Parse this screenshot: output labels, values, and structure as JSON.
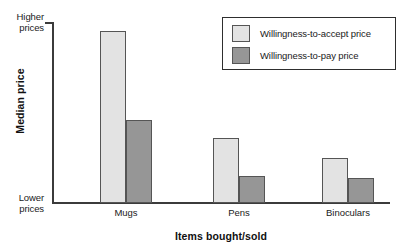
{
  "chart_data": {
    "type": "bar",
    "title": "",
    "subtitle": "",
    "xlabel": "Items bought/sold",
    "ylabel": "Median price",
    "categories": [
      "Mugs",
      "Pens",
      "Binoculars"
    ],
    "series": [
      {
        "name": "Willingness-to-accept price",
        "color": "#e3e3e3",
        "values": [
          95,
          36,
          25
        ]
      },
      {
        "name": "Willingness-to-pay price",
        "color": "#969696",
        "values": [
          46,
          15,
          14
        ]
      }
    ],
    "ylim": [
      0,
      100
    ],
    "y_axis_ticks": [
      {
        "label": "Lower prices",
        "value": 0
      },
      {
        "label": "Higher prices",
        "value": 100
      }
    ],
    "y_tick_low_line1": "Lower",
    "y_tick_low_line2": "prices",
    "y_tick_high_line1": "Higher",
    "y_tick_high_line2": "prices",
    "grid": false,
    "legend_position": "top-right",
    "axis_color": "#3b3b3b",
    "bar_edge_color": "#555555",
    "background": "#ffffff"
  },
  "legend": {
    "entries": [
      {
        "label": "Willingness-to-accept price",
        "color": "#e3e3e3"
      },
      {
        "label": "Willingness-to-pay price",
        "color": "#969696"
      }
    ]
  }
}
